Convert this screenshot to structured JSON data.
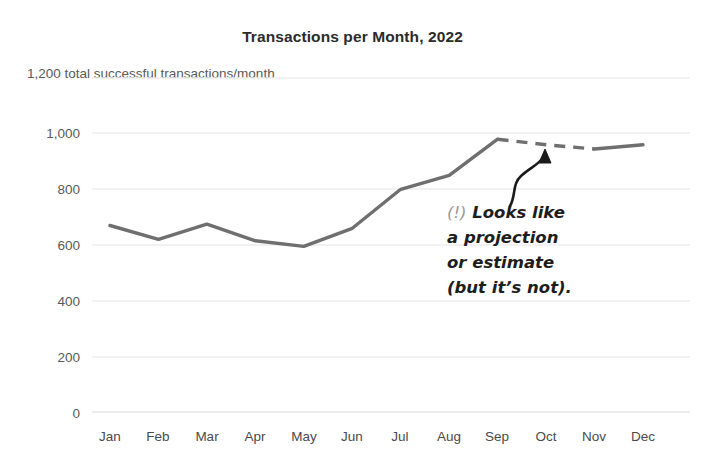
{
  "chart_data": {
    "type": "line",
    "title": "Transactions per Month, 2022",
    "subtitle": "1,200 total successful transactions/month",
    "xlabel": "",
    "ylabel": "",
    "categories": [
      "Jan",
      "Feb",
      "Mar",
      "Apr",
      "May",
      "Jun",
      "Jul",
      "Aug",
      "Sep",
      "Oct",
      "Nov",
      "Dec"
    ],
    "values": [
      670,
      620,
      675,
      615,
      595,
      660,
      800,
      850,
      980,
      960,
      945,
      960
    ],
    "series": [
      {
        "name": "Transactions",
        "values": [
          670,
          620,
          675,
          615,
          595,
          660,
          800,
          850,
          980,
          960,
          945,
          960
        ],
        "style_segments": [
          {
            "from": "Jan",
            "to": "Sep",
            "style": "solid"
          },
          {
            "from": "Sep",
            "to": "Nov",
            "style": "dashed"
          },
          {
            "from": "Nov",
            "to": "Dec",
            "style": "solid"
          }
        ],
        "color": "#6f6f6f"
      }
    ],
    "ylim": [
      0,
      1200
    ],
    "ytick_labels": [
      "1,200",
      "1,000",
      "800",
      "600",
      "400",
      "200",
      "0"
    ],
    "ytick_values": [
      1200,
      1000,
      800,
      600,
      400,
      200,
      0
    ],
    "grid": true,
    "grid_color": "#ededed",
    "legend": "none",
    "annotations": [
      {
        "name": "projection-callout",
        "lines": [
          "(!) Looks like",
          "a projection",
          "or estimate",
          "(but it’s not)."
        ],
        "marker": "(!)",
        "text_line_1": "Looks like",
        "text_line_2": "a projection",
        "text_line_3": "or estimate",
        "text_line_4": "(but it’s not).",
        "points_to": "dashed segment between Sep and Nov",
        "arrow": "curved-up-arrow"
      }
    ]
  },
  "axis": {
    "y_labels": [
      "1,000",
      "800",
      "600",
      "400",
      "200",
      "0"
    ],
    "x_labels": [
      "Jan",
      "Feb",
      "Mar",
      "Apr",
      "May",
      "Jun",
      "Jul",
      "Aug",
      "Sep",
      "Oct",
      "Nov",
      "Dec"
    ],
    "top_label": "1,200 total successful transactions/month"
  },
  "annotation": {
    "marker": "(!)",
    "line1": "Looks like",
    "line2": "a projection",
    "line3": "or estimate",
    "line4": "(but it’s not)."
  },
  "header": {
    "title": "Transactions per Month, 2022"
  },
  "colors": {
    "line": "#6f6f6f",
    "grid": "#ededed",
    "title": "#2b2b2b",
    "tick": "#595959",
    "annotation": "#1d1d1d",
    "annotation_marker": "#9a9a9a"
  }
}
